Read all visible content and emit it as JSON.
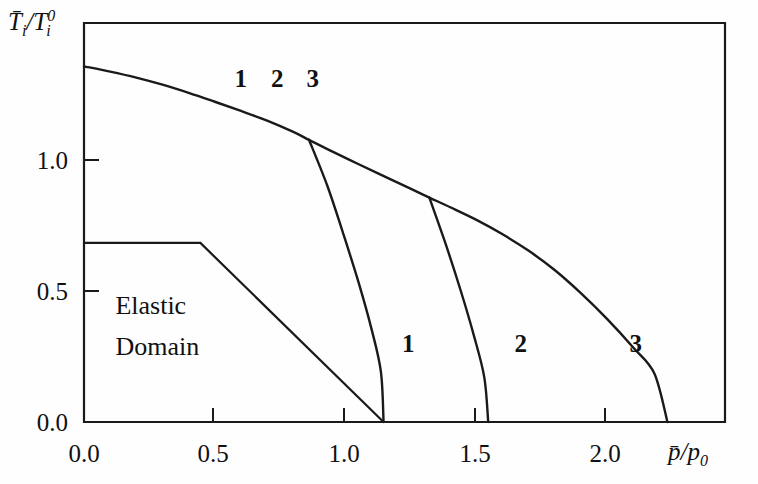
{
  "chart_data": {
    "type": "line",
    "title": "",
    "xlabel": "p̄/p₀",
    "ylabel": "T̄i/Ti⁰",
    "xlim": [
      0.0,
      2.45
    ],
    "ylim": [
      0.0,
      1.52
    ],
    "grid": false,
    "legend_position": "inline-annotations",
    "xticks": [
      0.0,
      0.5,
      1.0,
      1.5,
      2.0
    ],
    "xticklabels": [
      "0.0",
      "0.5",
      "1.0",
      "1.5",
      "2.0"
    ],
    "yticks": [
      0.0,
      0.5,
      1.0
    ],
    "yticklabels": [
      "0.0",
      "0.5",
      "1.0"
    ],
    "annotations": [
      {
        "text": "Elastic",
        "x": 0.12,
        "y": 0.41
      },
      {
        "text": "Domain",
        "x": 0.12,
        "y": 0.255
      },
      {
        "text": "1",
        "x": 0.575,
        "y": 1.275
      },
      {
        "text": "2",
        "x": 0.715,
        "y": 1.275
      },
      {
        "text": "3",
        "x": 0.85,
        "y": 1.275
      },
      {
        "text": "1",
        "x": 1.215,
        "y": 0.265
      },
      {
        "text": "2",
        "x": 1.645,
        "y": 0.265
      },
      {
        "text": "3",
        "x": 2.085,
        "y": 0.265
      }
    ],
    "series": [
      {
        "name": "envelope",
        "comment": "Upper failure envelope, p from 0 to 2.23",
        "points": [
          [
            0.0,
            1.355
          ],
          [
            0.1,
            1.335
          ],
          [
            0.2,
            1.312
          ],
          [
            0.3,
            1.285
          ],
          [
            0.4,
            1.254
          ],
          [
            0.5,
            1.22
          ],
          [
            0.6,
            1.185
          ],
          [
            0.7,
            1.148
          ],
          [
            0.8,
            1.105
          ],
          [
            0.86,
            1.075
          ],
          [
            0.95,
            1.03
          ],
          [
            1.05,
            0.982
          ],
          [
            1.15,
            0.935
          ],
          [
            1.25,
            0.888
          ],
          [
            1.32,
            0.855
          ],
          [
            1.4,
            0.818
          ],
          [
            1.5,
            0.77
          ],
          [
            1.6,
            0.715
          ],
          [
            1.7,
            0.652
          ],
          [
            1.8,
            0.578
          ],
          [
            1.9,
            0.49
          ],
          [
            2.0,
            0.392
          ],
          [
            2.1,
            0.283
          ],
          [
            2.18,
            0.185
          ],
          [
            2.23,
            0.0
          ]
        ]
      },
      {
        "name": "branch-1",
        "comment": "Unloading branch 1 departing envelope at p=0.86",
        "points": [
          [
            0.86,
            1.075
          ],
          [
            0.93,
            0.9
          ],
          [
            0.99,
            0.72
          ],
          [
            1.05,
            0.53
          ],
          [
            1.1,
            0.35
          ],
          [
            1.135,
            0.19
          ],
          [
            1.145,
            0.0
          ]
        ]
      },
      {
        "name": "branch-2",
        "comment": "Unloading branch 2 departing envelope at p=1.32",
        "points": [
          [
            1.32,
            0.855
          ],
          [
            1.38,
            0.685
          ],
          [
            1.44,
            0.5
          ],
          [
            1.49,
            0.33
          ],
          [
            1.53,
            0.17
          ],
          [
            1.545,
            0.0
          ]
        ]
      },
      {
        "name": "elastic-domain-boundary",
        "comment": "Initial yield surface: plateau then linear descent",
        "points": [
          [
            0.0,
            0.682
          ],
          [
            0.445,
            0.682
          ],
          [
            1.145,
            0.0
          ]
        ]
      }
    ]
  },
  "axes": {
    "y_label_parts": {
      "main": "T",
      "sub": "i",
      "num": "/T",
      "sub2": "i",
      "sup": "0"
    },
    "x_label_parts": {
      "main": "p",
      "den": "/p",
      "sub": "0"
    }
  }
}
